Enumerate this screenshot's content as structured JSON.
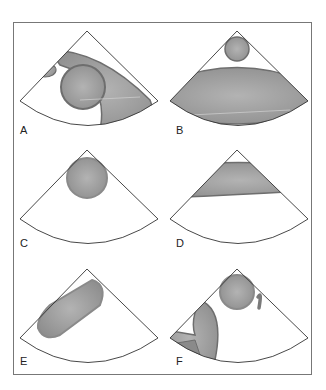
{
  "figure": {
    "panels": [
      {
        "id": "A",
        "label": "A",
        "content": "Elongated chamber crossing sector with large circle and small adjacent oval"
      },
      {
        "id": "B",
        "label": "B",
        "content": "Small circle near apex above wide curved band"
      },
      {
        "id": "C",
        "label": "C",
        "content": "Single circle near apex"
      },
      {
        "id": "D",
        "label": "D",
        "content": "Curved band near apex"
      },
      {
        "id": "E",
        "label": "E",
        "content": "Oblique elongated oval structure"
      },
      {
        "id": "F",
        "label": "F",
        "content": "Circle near apex with small curved structure and curved chamber on left"
      }
    ]
  },
  "colors": {
    "fill": "#9a9a9a",
    "fill_light": "#b5b5b5",
    "outline": "#6e6e6e",
    "sector_line": "#333333",
    "frame": "#777777"
  }
}
